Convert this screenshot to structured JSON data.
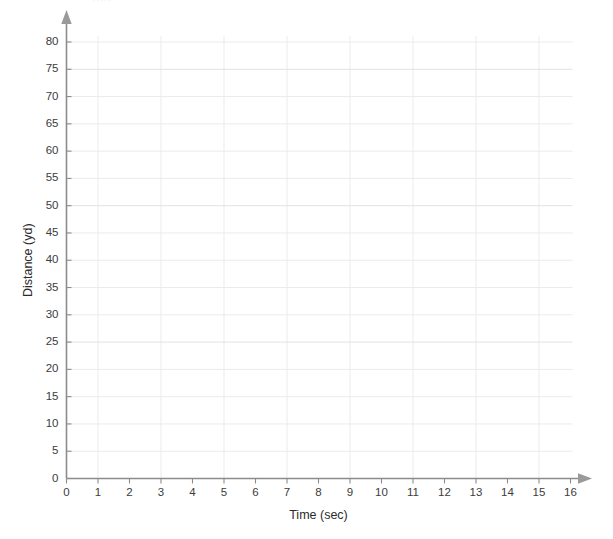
{
  "top_fragment": {
    "text": "·····",
    "note": "faint clipped text row at very top edge"
  },
  "chart_data": {
    "type": "scatter",
    "title": "",
    "subtitle": "",
    "xlabel": "Time (sec)",
    "ylabel": "Distance (yd)",
    "xlim": [
      0,
      16
    ],
    "ylim": [
      0,
      80
    ],
    "x_tick_step": 1,
    "y_tick_step": 5,
    "x_ticks": [
      0,
      1,
      2,
      3,
      4,
      5,
      6,
      7,
      8,
      9,
      10,
      11,
      12,
      13,
      14,
      15,
      16
    ],
    "y_ticks": [
      0,
      5,
      10,
      15,
      20,
      25,
      30,
      35,
      40,
      45,
      50,
      55,
      60,
      65,
      70,
      75,
      80
    ],
    "x_tick_labels": [
      "0",
      "1",
      "2",
      "3",
      "4",
      "5",
      "6",
      "7",
      "8",
      "9",
      "10",
      "11",
      "12",
      "13",
      "14",
      "15",
      "16"
    ],
    "y_tick_labels": [
      "0",
      "5",
      "10",
      "15",
      "20",
      "25",
      "30",
      "35",
      "40",
      "45",
      "50",
      "55",
      "60",
      "65",
      "70",
      "75",
      "80"
    ],
    "grid": true,
    "grid_x_values": [
      1,
      3,
      5,
      7,
      9,
      11,
      13,
      15
    ],
    "grid_y_values": [
      5,
      10,
      15,
      20,
      25,
      30,
      35,
      40,
      45,
      50,
      55,
      60,
      65,
      70,
      75,
      80
    ],
    "legend": null,
    "legend_position": "none",
    "annotations": [],
    "series": [],
    "x": [],
    "values": [],
    "data_points_present": false,
    "colors": {
      "grid": "#ebebeb",
      "grid_major": "#e2e2e2",
      "axis": "#8c8c8c",
      "arrow": "#9a9a9a",
      "tick_label": "#3c3c3c",
      "axis_title": "#2b2b2b",
      "background": "#ffffff"
    }
  }
}
